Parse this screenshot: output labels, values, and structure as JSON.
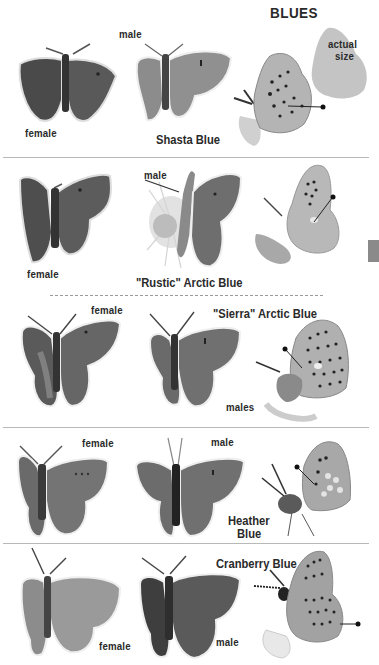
{
  "page": {
    "section_title": "BLUES",
    "actual_size_label": "actual\nsize",
    "actual_size_line1": "actual",
    "actual_size_line2": "size",
    "thumb_tab_color": "#8a8a8a"
  },
  "rows": [
    {
      "species": "Shasta Blue",
      "specimens": [
        {
          "label": "female",
          "view": "dorsal"
        },
        {
          "label": "male",
          "view": "dorsal"
        },
        {
          "label": "",
          "view": "ventral",
          "field_mark_pointer": true
        }
      ]
    },
    {
      "species": "\"Rustic\" Arctic Blue",
      "specimens": [
        {
          "label": "female",
          "view": "dorsal"
        },
        {
          "label": "male",
          "view": "dorsal"
        },
        {
          "label": "",
          "view": "ventral",
          "field_mark_pointer": true
        }
      ]
    },
    {
      "species": "\"Sierra\" Arctic Blue",
      "specimens": [
        {
          "label": "female",
          "view": "dorsal"
        },
        {
          "label": "",
          "view": "dorsal"
        },
        {
          "label": "",
          "view": "ventral",
          "field_mark_pointer": true
        }
      ],
      "group_label": "males"
    },
    {
      "species_line1": "Heather",
      "species_line2": "Blue",
      "species": "Heather Blue",
      "specimens": [
        {
          "label": "female",
          "view": "dorsal"
        },
        {
          "label": "male",
          "view": "dorsal"
        },
        {
          "label": "",
          "view": "ventral",
          "field_mark_pointer": true
        }
      ]
    },
    {
      "species": "Cranberry Blue",
      "specimens": [
        {
          "label": "female",
          "view": "dorsal"
        },
        {
          "label": "male",
          "view": "dorsal"
        },
        {
          "label": "",
          "view": "ventral",
          "field_mark_pointer": true
        }
      ]
    }
  ]
}
